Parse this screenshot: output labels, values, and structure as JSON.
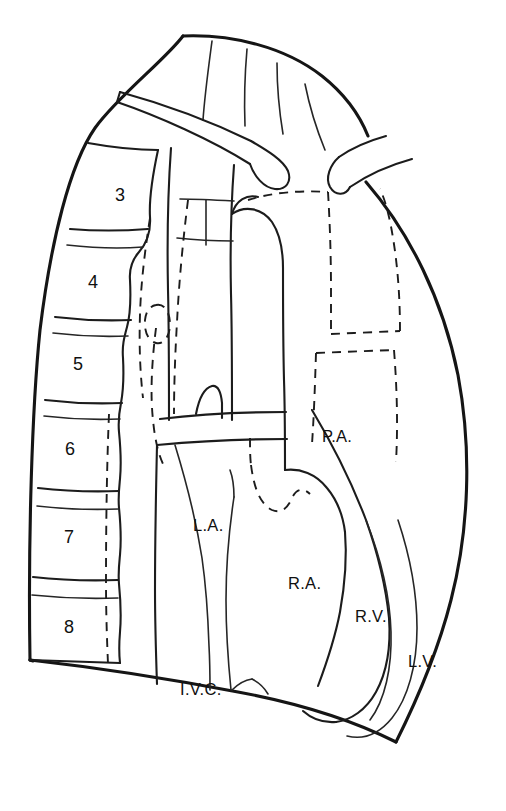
{
  "figure": {
    "background_color": "#ffffff",
    "line_color": "#151515"
  },
  "vertebrae": {
    "group_name": "thoracic-vertebral-bodies",
    "items": [
      {
        "number": "3",
        "x": 120,
        "y": 196
      },
      {
        "number": "4",
        "x": 93,
        "y": 283
      },
      {
        "number": "5",
        "x": 78,
        "y": 365
      },
      {
        "number": "6",
        "x": 70,
        "y": 450
      },
      {
        "number": "7",
        "x": 69,
        "y": 538
      },
      {
        "number": "8",
        "x": 69,
        "y": 628
      }
    ]
  },
  "structure_labels": [
    {
      "name": "pulmonary-artery",
      "text": "P.A.",
      "x": 322,
      "y": 438,
      "anchor": "start"
    },
    {
      "name": "left-atrium",
      "text": "L.A.",
      "x": 193,
      "y": 527,
      "anchor": "start"
    },
    {
      "name": "right-atrium",
      "text": "R.A.",
      "x": 288,
      "y": 585,
      "anchor": "start"
    },
    {
      "name": "right-ventricle",
      "text": "R.V.",
      "x": 355,
      "y": 618,
      "anchor": "start"
    },
    {
      "name": "left-ventricle",
      "text": "L.V.",
      "x": 408,
      "y": 663,
      "anchor": "start"
    },
    {
      "name": "inferior-vena-cava",
      "text": "I.V.C.",
      "x": 180,
      "y": 691,
      "anchor": "start"
    }
  ]
}
